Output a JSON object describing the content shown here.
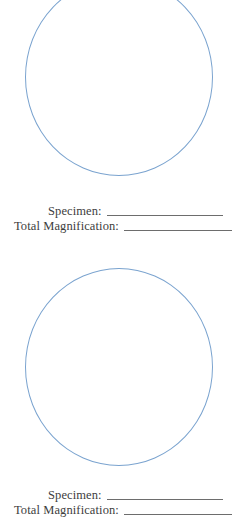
{
  "worksheet": {
    "blocks": [
      {
        "circle_name": "field-of-view-circle-1",
        "specimen_label": "Specimen:",
        "magnification_label": "Total Magnification:",
        "specimen_value": "",
        "magnification_value": ""
      },
      {
        "circle_name": "field-of-view-circle-2",
        "specimen_label": "Specimen:",
        "magnification_label": "Total Magnification:",
        "specimen_value": "",
        "magnification_value": ""
      }
    ],
    "colors": {
      "circle_stroke": "#7aa3cf",
      "rule_line": "#6d6d6d",
      "text": "#3d3d3d",
      "background": "#ffffff"
    }
  }
}
